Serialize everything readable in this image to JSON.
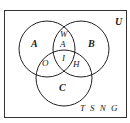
{
  "diagram": {
    "type": "venn",
    "universe_label": "U",
    "sets": [
      {
        "name": "A",
        "label": "A"
      },
      {
        "name": "B",
        "label": "B"
      },
      {
        "name": "C",
        "label": "C"
      }
    ],
    "regions": {
      "A_and_B_only": [
        "W",
        "A"
      ],
      "A_and_C_only": "O",
      "A_and_B_and_C": "I",
      "B_and_C_only": "H",
      "outside": "T S N G"
    },
    "colors": {
      "stroke": "#222222",
      "text": "#1a1a1a",
      "background": "#ffffff"
    }
  }
}
